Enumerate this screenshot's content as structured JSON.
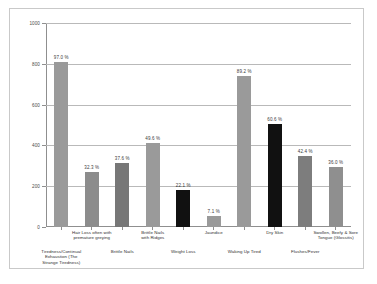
{
  "chart_data": {
    "type": "bar",
    "title": "",
    "subtitle": "",
    "xlabel": "",
    "ylabel": "",
    "ylim": [
      0,
      1000
    ],
    "yticks": [
      0,
      200,
      400,
      600,
      800,
      1000
    ],
    "grid": true,
    "legend": false,
    "categories": [
      "Tiredness/Continual Exhaustion (The Strange Tiredness)",
      "Hair Loss often with premature greying",
      "Brittle Nails",
      "Brittle Nails with Ridges",
      "Weight Loss",
      "Jaundice",
      "Waking Up Tired",
      "Dry Skin",
      "Flushes/Fever",
      "Swollen, Beefy & Sore Tongue (Glossitis)"
    ],
    "category_lines": [
      [
        "Tiredness/Continual",
        "Exhaustion (The",
        "Strange Tiredness)"
      ],
      [
        "Hair Loss often with",
        "premature greying"
      ],
      [
        "Brittle Nails"
      ],
      [
        "Brittle Nails",
        "with Ridges"
      ],
      [
        "Weight Loss"
      ],
      [
        "Jaundice"
      ],
      [
        "Waking Up Tired"
      ],
      [
        "Dry Skin"
      ],
      [
        "Flushes/Fever"
      ],
      [
        "Swollen, Beefy & Sore",
        "Tongue (Glossitis)"
      ]
    ],
    "values": [
      810,
      268,
      312,
      412,
      182,
      52,
      742,
      504,
      350,
      296
    ],
    "data_labels": [
      "97.0 %",
      "32.3 %",
      "37.6 %",
      "49.6 %",
      "22.1 %",
      "7.1 %",
      "89.2 %",
      "60.6 %",
      "42.4 %",
      "36.0 %"
    ],
    "percentages": [
      97.0,
      32.3,
      37.6,
      49.6,
      22.1,
      7.1,
      89.2,
      60.6,
      42.4,
      36.0
    ],
    "bar_colors": [
      "#9a9a9a",
      "#8c8c8c",
      "#777777",
      "#9a9a9a",
      "#111111",
      "#9a9a9a",
      "#9a9a9a",
      "#111111",
      "#7d7d7d",
      "#8f8f8f"
    ],
    "axis_color": "#8f8f8f",
    "grid_color": "#b9b9b9",
    "background": "#ffffff",
    "border_color": "#c9c9c9"
  }
}
